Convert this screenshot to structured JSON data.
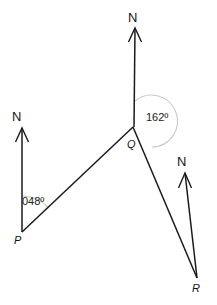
{
  "figure": {
    "width": 217,
    "height": 305,
    "background_color": "#ffffff",
    "line_color": "#1a1a1a",
    "arc_color": "#c9c9c9"
  },
  "north_arrows": [
    {
      "id": "north-at-p",
      "label": "N",
      "label_x": 12,
      "label_y": 110,
      "tip_x": 22,
      "tip_y": 128,
      "base_x": 22,
      "base_y": 232
    },
    {
      "id": "north-at-q",
      "label": "N",
      "label_x": 128,
      "label_y": 12,
      "tip_x": 135,
      "tip_y": 28,
      "base_x": 135,
      "base_y": 127
    },
    {
      "id": "north-at-r",
      "label": "N",
      "label_x": 177,
      "label_y": 155,
      "tip_x": 185,
      "tip_y": 173,
      "base_x": 197,
      "base_y": 278
    }
  ],
  "points": [
    {
      "id": "point-p",
      "label": "P",
      "x": 22,
      "y": 232,
      "label_x": 14,
      "label_y": 235
    },
    {
      "id": "point-q",
      "label": "Q",
      "x": 133,
      "y": 127,
      "label_x": 127,
      "label_y": 139
    },
    {
      "id": "point-r",
      "label": "R",
      "x": 197,
      "y": 278,
      "label_x": 192,
      "label_y": 283
    }
  ],
  "segments": [
    {
      "id": "segment-pq",
      "from": "P",
      "to": "Q",
      "x1": 22,
      "y1": 232,
      "x2": 133,
      "y2": 127
    },
    {
      "id": "segment-qr",
      "from": "Q",
      "to": "R",
      "x1": 133,
      "y1": 127,
      "x2": 197,
      "y2": 278
    }
  ],
  "angles": [
    {
      "id": "bearing-at-p",
      "value": "048",
      "degree_symbol": "º",
      "text": "048º",
      "vertex": "P",
      "label_x": 22,
      "label_y": 196,
      "arc_radius": 36
    },
    {
      "id": "bearing-at-q",
      "value": "162",
      "degree_symbol": "º",
      "text": "162º",
      "vertex": "Q",
      "label_x": 146,
      "label_y": 113,
      "arc_radius": 26
    }
  ]
}
